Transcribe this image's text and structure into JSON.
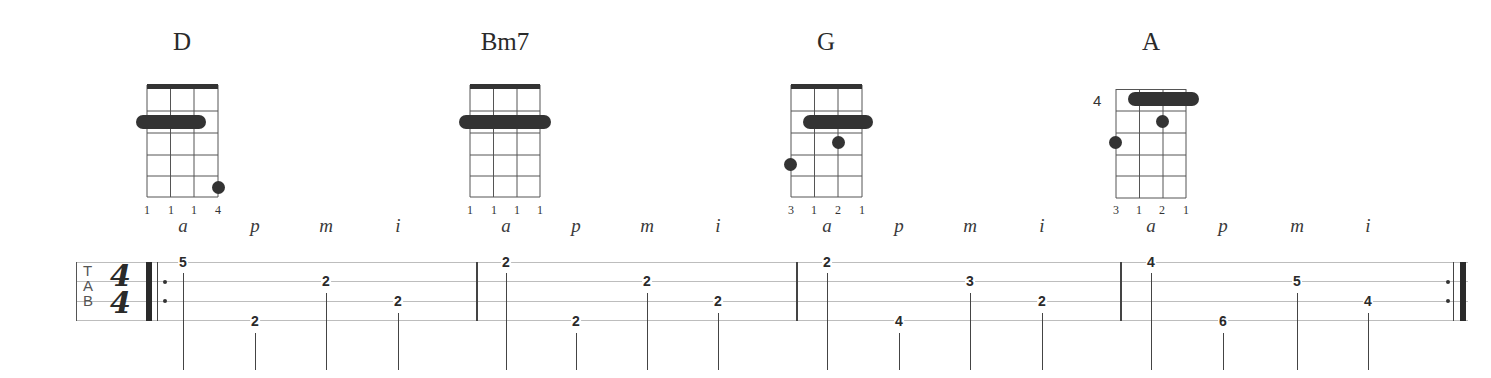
{
  "chords": [
    {
      "name": "D",
      "center_x": 182,
      "fingering": [
        "1",
        "1",
        "1",
        "4"
      ],
      "fret_label": ""
    },
    {
      "name": "Bm7",
      "center_x": 505,
      "fingering": [
        "1",
        "1",
        "1",
        "1"
      ],
      "fret_label": ""
    },
    {
      "name": "G",
      "center_x": 826,
      "fingering": [
        "3",
        "1",
        "2",
        "1"
      ],
      "fret_label": ""
    },
    {
      "name": "A",
      "center_x": 1151,
      "fingering": [
        "3",
        "1",
        "2",
        "1"
      ],
      "fret_label": "4"
    }
  ],
  "staff": {
    "clef": {
      "t": "T",
      "a": "A",
      "b": "B"
    },
    "time_signature": {
      "top": "4",
      "bottom": "4"
    },
    "strings": 4
  },
  "measures": [
    {
      "chord": "D",
      "notes": [
        {
          "finger": "a",
          "string": 1,
          "fret": "5"
        },
        {
          "finger": "p",
          "string": 4,
          "fret": "2"
        },
        {
          "finger": "m",
          "string": 2,
          "fret": "2"
        },
        {
          "finger": "i",
          "string": 3,
          "fret": "2"
        }
      ]
    },
    {
      "chord": "Bm7",
      "notes": [
        {
          "finger": "a",
          "string": 1,
          "fret": "2"
        },
        {
          "finger": "p",
          "string": 4,
          "fret": "2"
        },
        {
          "finger": "m",
          "string": 2,
          "fret": "2"
        },
        {
          "finger": "i",
          "string": 3,
          "fret": "2"
        }
      ]
    },
    {
      "chord": "G",
      "notes": [
        {
          "finger": "a",
          "string": 1,
          "fret": "2"
        },
        {
          "finger": "p",
          "string": 4,
          "fret": "4"
        },
        {
          "finger": "m",
          "string": 2,
          "fret": "3"
        },
        {
          "finger": "i",
          "string": 3,
          "fret": "2"
        }
      ]
    },
    {
      "chord": "A",
      "notes": [
        {
          "finger": "a",
          "string": 1,
          "fret": "4"
        },
        {
          "finger": "p",
          "string": 4,
          "fret": "6"
        },
        {
          "finger": "m",
          "string": 2,
          "fret": "5"
        },
        {
          "finger": "i",
          "string": 3,
          "fret": "4"
        }
      ]
    }
  ],
  "colors": {
    "ink": "#2a2a2a",
    "staff": "#bdbdbd",
    "dot": "#333333"
  }
}
